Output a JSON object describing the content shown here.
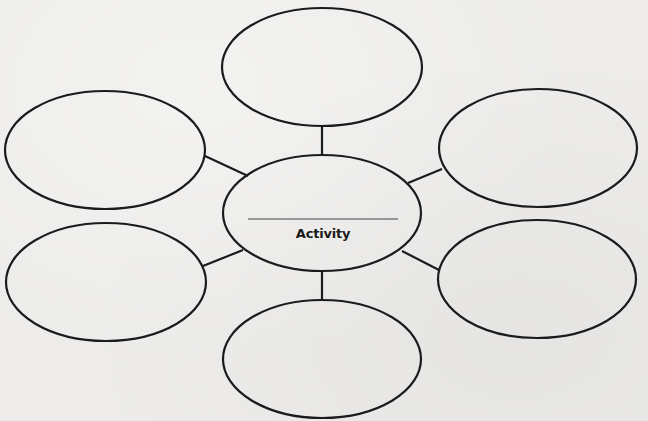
{
  "diagram": {
    "type": "web-organizer",
    "center": {
      "label": "Activity",
      "blank_line": "",
      "cx": 322,
      "cy": 213,
      "rx": 99,
      "ry": 58
    },
    "satellites": [
      {
        "id": "top",
        "label": "",
        "cx": 322,
        "cy": 67,
        "rx": 100,
        "ry": 59
      },
      {
        "id": "upper-left",
        "label": "",
        "cx": 105,
        "cy": 150,
        "rx": 100,
        "ry": 59
      },
      {
        "id": "upper-right",
        "label": "",
        "cx": 538,
        "cy": 148,
        "rx": 99,
        "ry": 59
      },
      {
        "id": "lower-left",
        "label": "",
        "cx": 106,
        "cy": 282,
        "rx": 100,
        "ry": 59
      },
      {
        "id": "lower-right",
        "label": "",
        "cx": 537,
        "cy": 279,
        "rx": 99,
        "ry": 59
      },
      {
        "id": "bottom",
        "label": "",
        "cx": 322,
        "cy": 359,
        "rx": 99,
        "ry": 59
      }
    ],
    "connectors": [
      {
        "from": "center",
        "to": "top",
        "x1": 322,
        "y1": 155,
        "x2": 322,
        "y2": 126
      },
      {
        "from": "center",
        "to": "upper-left",
        "x1": 248,
        "y1": 176,
        "x2": 205,
        "y2": 156
      },
      {
        "from": "center",
        "to": "upper-right",
        "x1": 408,
        "y1": 183,
        "x2": 442,
        "y2": 169
      },
      {
        "from": "center",
        "to": "lower-left",
        "x1": 243,
        "y1": 250,
        "x2": 203,
        "y2": 266
      },
      {
        "from": "center",
        "to": "lower-right",
        "x1": 402,
        "y1": 251,
        "x2": 439,
        "y2": 270
      },
      {
        "from": "center",
        "to": "bottom",
        "x1": 322,
        "y1": 271,
        "x2": 322,
        "y2": 300
      }
    ],
    "colors": {
      "background": "#edecea",
      "stroke": "#1b1b1b",
      "rule": "#7a7a7a"
    }
  }
}
